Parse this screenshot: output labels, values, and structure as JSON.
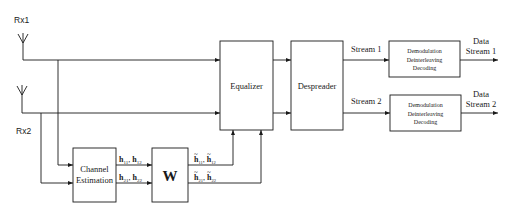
{
  "diagram": {
    "antennas": [
      {
        "label": "Rx1"
      },
      {
        "label": "Rx2"
      }
    ],
    "blocks": {
      "channel_estimation": {
        "line1": "Channel",
        "line2": "Estimation"
      },
      "w": {
        "label": "W"
      },
      "equalizer": {
        "label": "Equalizer"
      },
      "despreader": {
        "label": "Despreader"
      },
      "demod1": {
        "line1": "Demodulation",
        "line2": "Deinterleaving",
        "line3": "Decoding"
      },
      "demod2": {
        "line1": "Demodulation",
        "line2": "Deinterleaving",
        "line3": "Decoding"
      }
    },
    "edge_labels": {
      "h_top": {
        "a": "h",
        "a_sub": "11",
        "sep": ", ",
        "b": "h",
        "b_sub": "12"
      },
      "h_bottom": {
        "a": "h",
        "a_sub": "21",
        "sep": ", ",
        "b": "h",
        "b_sub": "22"
      },
      "htilde_top": {
        "tilde": "~",
        "a": "h",
        "a_sub": "11",
        "sep": ", ",
        "b": "h",
        "b_sub": "12"
      },
      "htilde_bottom": {
        "tilde": "~",
        "a": "h",
        "a_sub": "21",
        "sep": ", ",
        "b": "h",
        "b_sub": "22"
      },
      "stream1": "Stream 1",
      "stream2": "Stream 2"
    },
    "outputs": [
      {
        "line1": "Data",
        "line2": "Stream 1"
      },
      {
        "line1": "Data",
        "line2": "Stream 2"
      }
    ]
  }
}
